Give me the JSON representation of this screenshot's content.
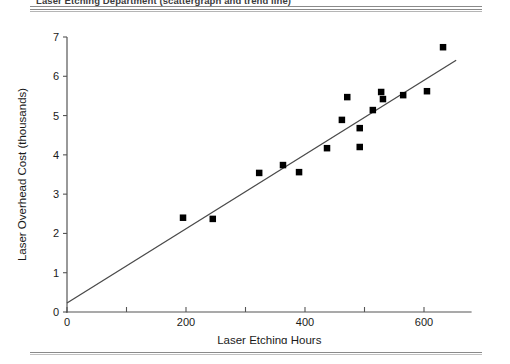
{
  "page": {
    "caption": "Laser Etching Department (scattergraph and trend line)",
    "background": "#ffffff",
    "rule_color": "#8a8a8a"
  },
  "chart_data": {
    "type": "scatter",
    "title": "",
    "xlabel": "Laser Etching Hours",
    "ylabel": "Laser Overhead Cost (thousands)",
    "xlim": [
      0,
      680
    ],
    "ylim": [
      0,
      7
    ],
    "x_major_ticks": [
      0,
      200,
      400,
      600
    ],
    "x_minor_ticks": [
      100,
      300,
      500
    ],
    "x_tick_labels": [
      "0",
      "200",
      "400",
      "600"
    ],
    "y_ticks": [
      0,
      1,
      2,
      3,
      4,
      5,
      6,
      7
    ],
    "y_tick_labels": [
      "0",
      "1",
      "2",
      "3",
      "4",
      "5",
      "6",
      "7"
    ],
    "grid": false,
    "legend": null,
    "marker": "square",
    "marker_color": "#000000",
    "points": [
      {
        "x": 195,
        "y": 2.4
      },
      {
        "x": 245,
        "y": 2.37
      },
      {
        "x": 323,
        "y": 3.54
      },
      {
        "x": 363,
        "y": 3.74
      },
      {
        "x": 390,
        "y": 3.56
      },
      {
        "x": 437,
        "y": 4.17
      },
      {
        "x": 462,
        "y": 4.89
      },
      {
        "x": 471,
        "y": 5.47
      },
      {
        "x": 492,
        "y": 4.68
      },
      {
        "x": 492,
        "y": 4.2
      },
      {
        "x": 514,
        "y": 5.14
      },
      {
        "x": 528,
        "y": 5.6
      },
      {
        "x": 531,
        "y": 5.42
      },
      {
        "x": 565,
        "y": 5.52
      },
      {
        "x": 605,
        "y": 5.62
      },
      {
        "x": 632,
        "y": 6.74
      }
    ],
    "trend_line": {
      "name": "trend line",
      "color": "#4a4a4a",
      "intercept": 0.23,
      "slope": 0.00945,
      "x_start": 0,
      "x_end": 654,
      "y_start": 0.23,
      "y_end": 6.41
    }
  }
}
